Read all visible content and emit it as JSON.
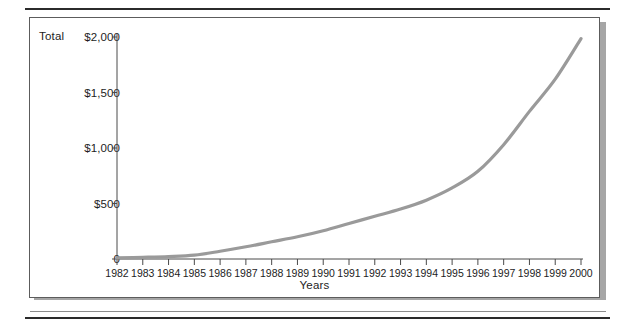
{
  "figure": {
    "y_axis_title": "Total",
    "x_axis_title": "Years"
  },
  "colors": {
    "line": "#9a9a9a",
    "axis": "#4a4a4a",
    "text": "#1d1d1d",
    "frame": "#5c5c5c",
    "shadow": "#a6a6a6",
    "rule": "#2b2b2b",
    "background": "#ffffff"
  },
  "chart_data": {
    "type": "line",
    "title": "",
    "xlabel": "Years",
    "ylabel": "Total",
    "x": [
      1982,
      1983,
      1984,
      1985,
      1986,
      1987,
      1988,
      1989,
      1990,
      1991,
      1992,
      1993,
      1994,
      1995,
      1996,
      1997,
      1998,
      1999,
      2000
    ],
    "categories": [
      "1982",
      "1983",
      "1984",
      "1985",
      "1986",
      "1987",
      "1988",
      "1989",
      "1990",
      "1991",
      "1992",
      "1993",
      "1994",
      "1995",
      "1996",
      "1997",
      "1998",
      "1999",
      "2000"
    ],
    "values": [
      10,
      15,
      22,
      35,
      70,
      110,
      155,
      200,
      255,
      320,
      385,
      450,
      530,
      640,
      790,
      1030,
      1330,
      1620,
      1985
    ],
    "ytick_labels": [
      "0",
      "$500",
      "$1,000",
      "$1,500",
      "$2,000"
    ],
    "ytick_values": [
      0,
      500,
      1000,
      1500,
      2000
    ],
    "ylim": [
      0,
      2000
    ],
    "xlim": [
      1982,
      2000
    ],
    "grid": false,
    "legend": false,
    "legend_position": "none",
    "series": [
      {
        "name": "Total",
        "values": [
          10,
          15,
          22,
          35,
          70,
          110,
          155,
          200,
          255,
          320,
          385,
          450,
          530,
          640,
          790,
          1030,
          1330,
          1620,
          1985
        ]
      }
    ]
  }
}
